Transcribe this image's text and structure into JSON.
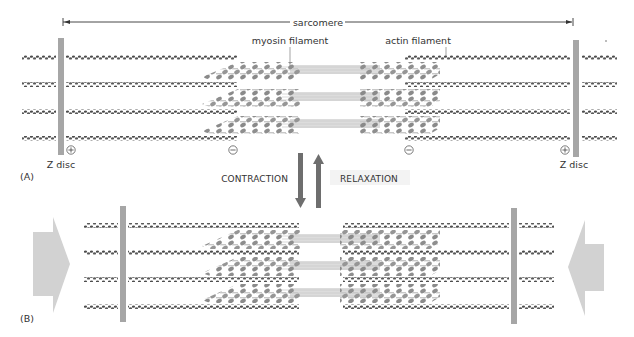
{
  "figure": {
    "panels": [
      {
        "id": "A",
        "label": "(A)",
        "state": "relaxed"
      },
      {
        "id": "B",
        "label": "(B)",
        "state": "contracted"
      }
    ],
    "labels": {
      "sarcomere": "sarcomere",
      "myosin": "myosin filament",
      "actin": "actin filament",
      "z_disc_left": "Z disc",
      "z_disc_right": "Z disc",
      "contraction": "CONTRACTION",
      "relaxation": "RELAXATION",
      "plus_end": "+",
      "minus_end": "−"
    },
    "colors": {
      "z_disc": "#a6a6a6",
      "actin": "#555555",
      "myosin_head": "#8c8c8c",
      "myosin_tail": "#d4d4d4",
      "myosin_backbone": "#dadada",
      "arrow_dark": "#6e6e6e",
      "push_arrow": "#d2d2d2",
      "text": "#333333"
    },
    "icons": {
      "plus_circle": "plus-circle-icon",
      "minus_circle": "minus-circle-icon",
      "contraction_arrow": "arrow-down-icon",
      "relaxation_arrow": "arrow-up-icon"
    }
  }
}
